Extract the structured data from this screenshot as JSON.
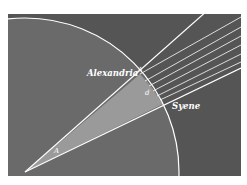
{
  "diagram": {
    "labels": {
      "alexandria": "Alexandria",
      "syene": "Syene",
      "shadow_angle": "A",
      "arc_distance": "d",
      "center_angle": "A"
    },
    "colors": {
      "background": "#555555",
      "earth": "#6a6a6a",
      "wedge": "#9a9a9a",
      "lines": "#ffffff",
      "page": "#ffffff"
    },
    "sun_rays_count": 6
  }
}
